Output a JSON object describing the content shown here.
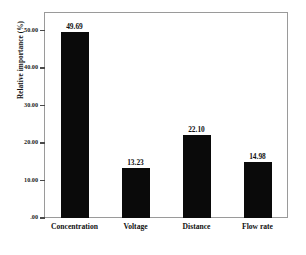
{
  "chart_data": {
    "type": "bar",
    "title": "",
    "subtitle": "",
    "xlabel": "",
    "ylabel": "Relative importance (%)",
    "categories": [
      "Concentration",
      "Voltage",
      "Distance",
      "Flow rate"
    ],
    "values": [
      49.69,
      13.23,
      22.1,
      14.98
    ],
    "value_labels": [
      "49.69",
      "13.23",
      "22.10",
      "14.98"
    ],
    "ylim": [
      0,
      55
    ],
    "yticks": [
      0,
      10,
      20,
      30,
      40,
      50
    ],
    "ytick_labels": [
      ".00",
      "10.00",
      "20.00",
      "30.00",
      "40.00",
      "50.00"
    ],
    "grid": false,
    "legend": null,
    "bar_color": "#0a0a0a",
    "frame_color": "#9a9a9a",
    "background_color": "#ffffff"
  },
  "axes": {
    "y_title": "Relative importance (%)"
  }
}
